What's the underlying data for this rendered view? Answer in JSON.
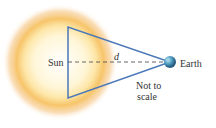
{
  "labels": {
    "sun": "Sun",
    "earth": "Earth",
    "distance": "d",
    "note_line1": "Not to",
    "note_line2": "scale"
  },
  "colors": {
    "triangle": "#4a78b8",
    "sun_core": "#fffbe8",
    "sun_glow": "#f3a93a",
    "earth": "#3a8ab0",
    "dashed_line": "#555555"
  }
}
